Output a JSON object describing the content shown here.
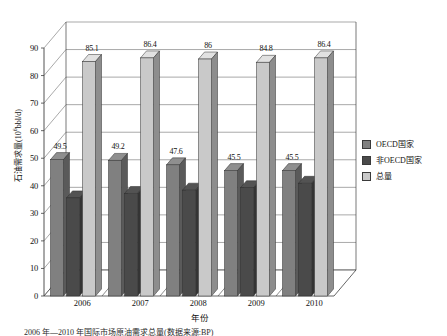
{
  "chart_data": {
    "type": "bar",
    "title": "",
    "xlabel": "年份",
    "ylabel": "石油需求量(10⁶bbl/d)",
    "ylabel_base": "石油需求量(10",
    "ylabel_sup": "6",
    "ylabel_tail": "bbl/d)",
    "categories": [
      "2006",
      "2007",
      "2008",
      "2009",
      "2010"
    ],
    "ylim": [
      0,
      90
    ],
    "yticks": [
      0,
      10,
      20,
      30,
      40,
      50,
      60,
      70,
      80,
      90
    ],
    "ytick_labels": [
      "0",
      "10",
      "20",
      "30",
      "40",
      "50",
      "60",
      "70",
      "80",
      "90"
    ],
    "grid": true,
    "legend_position": "right",
    "style": "3d-grouped-bar",
    "series": [
      {
        "name": "OECD国家",
        "color": "#808080",
        "values": [
          49.5,
          49.2,
          47.6,
          45.5,
          45.5
        ],
        "labels": [
          "49.5",
          "49.2",
          "47.6",
          "45.5",
          "45.5"
        ],
        "labels_shown": true
      },
      {
        "name": "非OECD国家",
        "color": "#4a4a4a",
        "values": [
          35.6,
          37.2,
          38.4,
          39.3,
          40.9
        ],
        "labels": [
          "",
          "",
          "",
          "",
          ""
        ],
        "labels_shown": false
      },
      {
        "name": "总量",
        "color": "#c9c9c9",
        "values": [
          85.1,
          86.4,
          86.0,
          84.8,
          86.4
        ],
        "labels": [
          "85.1",
          "86.4",
          "86",
          "84.8",
          "86.4"
        ],
        "labels_shown": true
      }
    ]
  },
  "legend": {
    "items": [
      {
        "label": "OECD国家",
        "color": "#808080"
      },
      {
        "label": "非OECD国家",
        "color": "#4a4a4a"
      },
      {
        "label": "总量",
        "color": "#c9c9c9"
      }
    ]
  },
  "colors": {
    "oecd": "#808080",
    "non_oecd": "#4a4a4a",
    "total": "#c9c9c9",
    "axis": "#3f3f3f",
    "grid": "#6e6e6e",
    "background": "#ffffff"
  },
  "caption": {
    "text": "2006 年―2010 年国际市场原油需求总量(数据来源:BP)"
  }
}
